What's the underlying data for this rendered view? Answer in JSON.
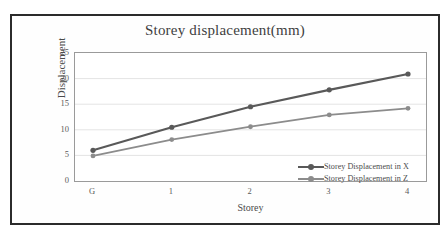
{
  "chart_data": {
    "type": "line",
    "title": "Storey displacement(mm)",
    "xlabel": "Storey",
    "ylabel": "Displacement",
    "categories": [
      "G",
      "1",
      "2",
      "3",
      "4"
    ],
    "series": [
      {
        "name": "Storey Displacement in X",
        "color": "#595959",
        "values": [
          6.0,
          10.5,
          14.5,
          17.8,
          20.9
        ]
      },
      {
        "name": "Storey Displacement in Z",
        "color": "#8c8c8c",
        "values": [
          4.9,
          8.1,
          10.6,
          12.9,
          14.2
        ]
      }
    ],
    "ylim": [
      0,
      25
    ],
    "yticks": [
      0,
      5,
      10,
      15,
      20,
      25
    ],
    "grid": true,
    "legend_position": "inside-bottom-right",
    "markers": "circle"
  },
  "figure": {
    "border_color": "#2b2b2b",
    "background": "#ffffff",
    "plot_border_color": "#9a9a9a",
    "gridline_color": "#e4e4e4"
  }
}
